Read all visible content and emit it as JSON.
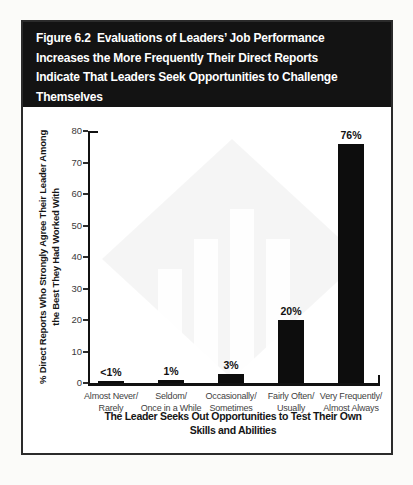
{
  "figure": {
    "header_title": "Figure 6.2  Evaluations of Leaders’ Job Performance\nIncreases the More Frequently Their Direct Reports\nIndicate That Leaders Seek Opportunities to Challenge\nThemselves"
  },
  "colors": {
    "header_bg": "#131313",
    "header_text": "#ffffff",
    "bar": "#0d0d0d",
    "axis": "#111111",
    "tick_label": "#3a3a3a",
    "category_label": "#3f3f3f",
    "frame_border": "#2b2b2b"
  },
  "chart_data": {
    "type": "bar",
    "title": "Figure 6.2 Evaluations of Leaders’ Job Performance Increases the More Frequently Their Direct Reports Indicate That Leaders Seek Opportunities to Challenge Themselves",
    "categories": [
      "Almost Never/\nRarely",
      "Seldom/\nOnce in a While",
      "Occasionally/\nSometimes",
      "Fairly Often/\nUsually",
      "Very Frequently/\nAlmost Always"
    ],
    "values": [
      0.5,
      1,
      3,
      20,
      76
    ],
    "value_labels": [
      "<1%",
      "1%",
      "3%",
      "20%",
      "76%"
    ],
    "xlabel": "The Leader Seeks Out Opportunities to Test Their Own\nSkills and Abilities",
    "ylabel": "% Direct Reports Who Strongly Agree Their Leader Among\nthe Best They Had Worked With",
    "ylim": [
      0,
      80
    ],
    "yticks": [
      0,
      10,
      20,
      30,
      40,
      50,
      60,
      70,
      80
    ],
    "grid": false,
    "legend": null,
    "bar_color": "#0d0d0d"
  }
}
